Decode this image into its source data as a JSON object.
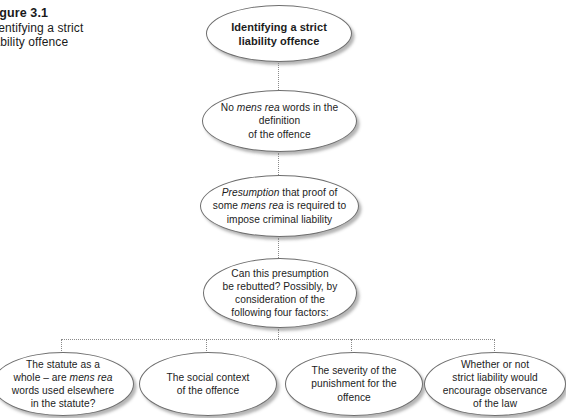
{
  "figure": {
    "caption_title": "Figure 3.1",
    "caption_line1": "Identifying a strict",
    "caption_line2": "liability offence"
  },
  "colors": {
    "node_stroke": "#6e6e6e",
    "connector": "#8a8a8a",
    "text": "#1c1c1c",
    "background": "#ffffff"
  },
  "chain": {
    "node1": {
      "line1": "Identifying a strict",
      "line2": "liability offence"
    },
    "node2": {
      "seg1": "No ",
      "em1": "mens rea",
      "seg2": " words in the",
      "line2": "definition",
      "line3": "of the offence"
    },
    "node3": {
      "em1": "Presumption",
      "seg1": " that proof of",
      "seg2": "some ",
      "em2": "mens rea",
      "seg3": " is required to",
      "line3": "impose criminal liability"
    },
    "node4": {
      "line1": "Can this presumption",
      "line2": "be rebutted? Possibly, by",
      "line3": "consideration of the",
      "line4": "following four factors:"
    }
  },
  "factors": {
    "factor1": {
      "line1": "The statute as a",
      "seg1": "whole – are ",
      "em1": "mens rea",
      "line3": "words used elsewhere",
      "line4": "in the statute?"
    },
    "factor2": {
      "line1": "The social context",
      "line2": "of the offence"
    },
    "factor3": {
      "line1": "The severity of the",
      "line2": "punishment for the",
      "line3": "offence"
    },
    "factor4": {
      "line1": "Whether or not",
      "line2": "strict liability would",
      "line3": "encourage observance",
      "line4": "of the law"
    }
  }
}
